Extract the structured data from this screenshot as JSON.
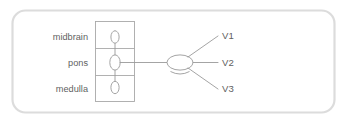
{
  "figure": {
    "panel": {
      "background_color": "#ffffff",
      "border_color": "#dcdcdc"
    },
    "stroke_color": "#9a9a9a",
    "text_color": "#5f5f5f",
    "brainstem": {
      "name": "brainstem-column",
      "regions": [
        {
          "id": "midbrain",
          "label": "midbrain"
        },
        {
          "id": "pons",
          "label": "pons"
        },
        {
          "id": "medulla",
          "label": "medulla"
        }
      ],
      "nuclei": [
        {
          "id": "mesencephalic-nucleus",
          "region": "midbrain"
        },
        {
          "id": "main-sensory-nucleus",
          "region": "pons"
        },
        {
          "id": "spinal-nucleus",
          "region": "medulla"
        }
      ]
    },
    "ganglion": {
      "id": "trigeminal-ganglion",
      "label": ""
    },
    "branches": [
      {
        "id": "v1",
        "label": "V1"
      },
      {
        "id": "v2",
        "label": "V2"
      },
      {
        "id": "v3",
        "label": "V3"
      }
    ]
  }
}
